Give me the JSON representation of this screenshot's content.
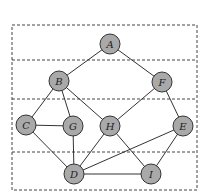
{
  "diagram": {
    "type": "graph",
    "frame": {
      "x": 12,
      "y": 25,
      "width": 185,
      "height": 165
    },
    "layer_dividers_y": [
      60,
      99,
      152
    ],
    "colors": {
      "node_fill": "#a9a9a9",
      "node_stroke": "#333333",
      "edge": "#333333",
      "dashed": "#444444"
    },
    "node_radius": 10,
    "nodes": [
      {
        "id": "A",
        "label": "A",
        "x": 110,
        "y": 44
      },
      {
        "id": "B",
        "label": "B",
        "x": 59,
        "y": 81
      },
      {
        "id": "F",
        "label": "F",
        "x": 162,
        "y": 82
      },
      {
        "id": "C",
        "label": "C",
        "x": 26,
        "y": 125
      },
      {
        "id": "G",
        "label": "G",
        "x": 73,
        "y": 126
      },
      {
        "id": "H",
        "label": "H",
        "x": 110,
        "y": 126
      },
      {
        "id": "E",
        "label": "E",
        "x": 183,
        "y": 126
      },
      {
        "id": "D",
        "label": "D",
        "x": 74,
        "y": 174
      },
      {
        "id": "I",
        "label": "I",
        "x": 151,
        "y": 174
      }
    ],
    "edges": [
      [
        "A",
        "B"
      ],
      [
        "A",
        "F"
      ],
      [
        "B",
        "C"
      ],
      [
        "B",
        "G"
      ],
      [
        "B",
        "H"
      ],
      [
        "F",
        "H"
      ],
      [
        "F",
        "E"
      ],
      [
        "C",
        "G"
      ],
      [
        "C",
        "D"
      ],
      [
        "G",
        "D"
      ],
      [
        "H",
        "D"
      ],
      [
        "H",
        "I"
      ],
      [
        "E",
        "D"
      ],
      [
        "E",
        "I"
      ],
      [
        "D",
        "I"
      ]
    ]
  }
}
